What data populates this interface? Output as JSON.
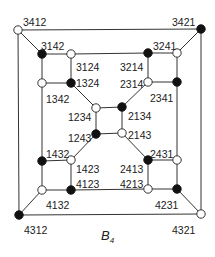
{
  "caption": {
    "main": "B",
    "sub": "4"
  },
  "nodes": [
    {
      "id": "3412",
      "x": 18,
      "y": 30,
      "fill": "white",
      "lx": 23,
      "ly": 22
    },
    {
      "id": "3421",
      "x": 201,
      "y": 29,
      "fill": "black",
      "lx": 172,
      "ly": 22
    },
    {
      "id": "4312",
      "x": 19,
      "y": 215,
      "fill": "black",
      "lx": 24,
      "ly": 230
    },
    {
      "id": "4321",
      "x": 201,
      "y": 214,
      "fill": "white",
      "lx": 172,
      "ly": 230
    },
    {
      "id": "3142",
      "x": 42,
      "y": 54,
      "fill": "black",
      "lx": 41,
      "ly": 46
    },
    {
      "id": "3124",
      "x": 71,
      "y": 54,
      "fill": "white",
      "lx": 76,
      "ly": 67
    },
    {
      "id": "3214",
      "x": 148,
      "y": 53,
      "fill": "black",
      "lx": 120,
      "ly": 67
    },
    {
      "id": "3241",
      "x": 177,
      "y": 53,
      "fill": "white",
      "lx": 153,
      "ly": 46
    },
    {
      "id": "1342",
      "x": 42,
      "y": 83,
      "fill": "white",
      "lx": 46,
      "ly": 99
    },
    {
      "id": "1324",
      "x": 71,
      "y": 83,
      "fill": "black",
      "lx": 76,
      "ly": 83
    },
    {
      "id": "2314",
      "x": 148,
      "y": 82,
      "fill": "white",
      "lx": 120,
      "ly": 84
    },
    {
      "id": "2341",
      "x": 177,
      "y": 82,
      "fill": "black",
      "lx": 150,
      "ly": 98
    },
    {
      "id": "1234",
      "x": 96,
      "y": 108,
      "fill": "white",
      "lx": 68,
      "ly": 117
    },
    {
      "id": "2134",
      "x": 122,
      "y": 107,
      "fill": "black",
      "lx": 128,
      "ly": 116
    },
    {
      "id": "1243",
      "x": 96,
      "y": 134,
      "fill": "black",
      "lx": 68,
      "ly": 138
    },
    {
      "id": "2143",
      "x": 122,
      "y": 133,
      "fill": "white",
      "lx": 128,
      "ly": 135
    },
    {
      "id": "1432",
      "x": 42,
      "y": 161,
      "fill": "black",
      "lx": 46,
      "ly": 154
    },
    {
      "id": "1423",
      "x": 71,
      "y": 160,
      "fill": "white",
      "lx": 76,
      "ly": 169
    },
    {
      "id": "2413",
      "x": 148,
      "y": 160,
      "fill": "black",
      "lx": 120,
      "ly": 169
    },
    {
      "id": "2431",
      "x": 177,
      "y": 160,
      "fill": "white",
      "lx": 150,
      "ly": 154
    },
    {
      "id": "4132",
      "x": 42,
      "y": 190,
      "fill": "white",
      "lx": 46,
      "ly": 205
    },
    {
      "id": "4123",
      "x": 71,
      "y": 190,
      "fill": "black",
      "lx": 76,
      "ly": 184
    },
    {
      "id": "4213",
      "x": 148,
      "y": 189,
      "fill": "white",
      "lx": 120,
      "ly": 184
    },
    {
      "id": "4231",
      "x": 177,
      "y": 189,
      "fill": "black",
      "lx": 155,
      "ly": 205
    }
  ],
  "edges": [
    [
      "3412",
      "3421"
    ],
    [
      "3421",
      "4321"
    ],
    [
      "4321",
      "4312"
    ],
    [
      "4312",
      "3412"
    ],
    [
      "3412",
      "3142"
    ],
    [
      "3421",
      "3241"
    ],
    [
      "4312",
      "4132"
    ],
    [
      "4321",
      "4231"
    ],
    [
      "3142",
      "3124"
    ],
    [
      "3124",
      "3214"
    ],
    [
      "3214",
      "3241"
    ],
    [
      "3142",
      "1342"
    ],
    [
      "3124",
      "1324"
    ],
    [
      "3214",
      "2314"
    ],
    [
      "3241",
      "2341"
    ],
    [
      "1342",
      "1324"
    ],
    [
      "2314",
      "2341"
    ],
    [
      "1342",
      "1432"
    ],
    [
      "2341",
      "2431"
    ],
    [
      "1324",
      "1234"
    ],
    [
      "2314",
      "2134"
    ],
    [
      "1234",
      "2134"
    ],
    [
      "2134",
      "2143"
    ],
    [
      "2143",
      "1243"
    ],
    [
      "1243",
      "1234"
    ],
    [
      "1243",
      "1423"
    ],
    [
      "2143",
      "2413"
    ],
    [
      "1432",
      "1423"
    ],
    [
      "2413",
      "2431"
    ],
    [
      "1432",
      "4132"
    ],
    [
      "1423",
      "4123"
    ],
    [
      "2413",
      "4213"
    ],
    [
      "2431",
      "4231"
    ],
    [
      "4132",
      "4123"
    ],
    [
      "4123",
      "4213"
    ],
    [
      "4213",
      "4231"
    ]
  ]
}
